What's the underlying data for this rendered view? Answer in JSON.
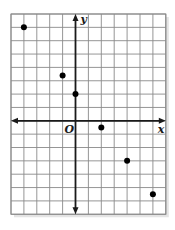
{
  "chart_data": {
    "type": "scatter",
    "title": "",
    "xlabel": "x",
    "ylabel": "y",
    "origin_label": "O",
    "xlim": [
      -5,
      7
    ],
    "ylim": [
      -7,
      8
    ],
    "grid": true,
    "tick_labels": false,
    "legend": null,
    "points": [
      {
        "x": -4,
        "y": 7
      },
      {
        "x": -1,
        "y": 3.4
      },
      {
        "x": 0,
        "y": 2
      },
      {
        "x": 2,
        "y": -0.5
      },
      {
        "x": 4,
        "y": -3
      },
      {
        "x": 6,
        "y": -5.5
      }
    ]
  },
  "layout": {
    "left_px": 11,
    "top_px": 14,
    "cell_w_px": 12.9,
    "cell_h_px": 13.35
  },
  "colors": {
    "grid": "#8a8a8a",
    "axis": "#1a1a1a",
    "point": "#000000"
  }
}
